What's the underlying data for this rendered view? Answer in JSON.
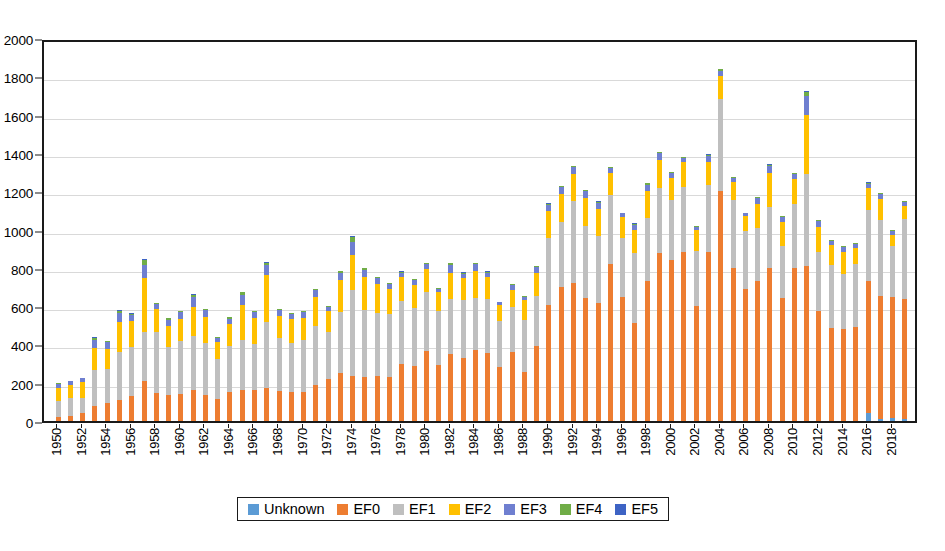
{
  "chart_data": {
    "type": "bar",
    "stacked": true,
    "title": "",
    "xlabel": "",
    "ylabel": "",
    "ylim": [
      0,
      2000
    ],
    "ytick_step": 200,
    "yticks": [
      0,
      200,
      400,
      600,
      800,
      1000,
      1200,
      1400,
      1600,
      1800,
      2000
    ],
    "grid": true,
    "xtick_interval": 2,
    "legend_position": "bottom",
    "categories": [
      "1950",
      "1951",
      "1952",
      "1953",
      "1954",
      "1955",
      "1956",
      "1957",
      "1958",
      "1959",
      "1960",
      "1961",
      "1962",
      "1963",
      "1964",
      "1965",
      "1966",
      "1967",
      "1968",
      "1969",
      "1970",
      "1971",
      "1972",
      "1973",
      "1974",
      "1975",
      "1976",
      "1977",
      "1978",
      "1979",
      "1980",
      "1981",
      "1982",
      "1983",
      "1984",
      "1985",
      "1986",
      "1987",
      "1988",
      "1989",
      "1990",
      "1991",
      "1992",
      "1993",
      "1994",
      "1995",
      "1996",
      "1997",
      "1998",
      "1999",
      "2000",
      "2001",
      "2002",
      "2003",
      "2004",
      "2005",
      "2006",
      "2007",
      "2008",
      "2009",
      "2010",
      "2011",
      "2012",
      "2013",
      "2014",
      "2015",
      "2016",
      "2017",
      "2018",
      "2019"
    ],
    "xtick_labels": [
      "1950",
      "1952",
      "1954",
      "1956",
      "1958",
      "1960",
      "1962",
      "1964",
      "1966",
      "1968",
      "1970",
      "1972",
      "1974",
      "1976",
      "1978",
      "1980",
      "1982",
      "1984",
      "1986",
      "1988",
      "1990",
      "1992",
      "1994",
      "1996",
      "1998",
      "2000",
      "2002",
      "2004",
      "2006",
      "2008",
      "2010",
      "2012",
      "2014",
      "2016",
      "2018"
    ],
    "series": [
      {
        "name": "Unknown",
        "color": "#5b9bd5",
        "values": [
          0,
          0,
          0,
          0,
          0,
          0,
          0,
          0,
          0,
          0,
          0,
          0,
          0,
          0,
          0,
          0,
          0,
          0,
          0,
          0,
          0,
          0,
          0,
          0,
          0,
          0,
          0,
          0,
          0,
          0,
          0,
          0,
          0,
          0,
          0,
          0,
          0,
          0,
          0,
          0,
          0,
          0,
          0,
          0,
          0,
          0,
          0,
          0,
          0,
          0,
          0,
          0,
          0,
          0,
          0,
          0,
          0,
          0,
          0,
          0,
          0,
          0,
          0,
          0,
          0,
          0,
          40,
          12,
          18,
          10
        ]
      },
      {
        "name": "EF0",
        "color": "#ed7d31",
        "values": [
          20,
          24,
          40,
          80,
          96,
          110,
          130,
          210,
          145,
          135,
          140,
          160,
          135,
          115,
          150,
          160,
          160,
          175,
          155,
          150,
          150,
          190,
          220,
          250,
          235,
          230,
          235,
          230,
          300,
          285,
          365,
          290,
          350,
          330,
          370,
          355,
          280,
          360,
          255,
          390,
          605,
          700,
          720,
          640,
          615,
          820,
          645,
          510,
          730,
          875,
          840,
          880,
          600,
          880,
          1200,
          800,
          690,
          730,
          800,
          640,
          800,
          810,
          575,
          485,
          480,
          490,
          690,
          640,
          630,
          625
        ]
      },
      {
        "name": "EF1",
        "color": "#bfbfbf",
        "values": [
          85,
          95,
          80,
          185,
          175,
          250,
          255,
          255,
          320,
          250,
          280,
          285,
          270,
          210,
          240,
          265,
          240,
          340,
          280,
          260,
          275,
          305,
          245,
          320,
          450,
          350,
          330,
          330,
          325,
          305,
          310,
          285,
          285,
          300,
          275,
          280,
          240,
          235,
          270,
          265,
          350,
          340,
          430,
          380,
          350,
          360,
          310,
          370,
          330,
          340,
          315,
          340,
          290,
          355,
          480,
          355,
          300,
          280,
          320,
          275,
          335,
          480,
          310,
          330,
          290,
          330,
          370,
          400,
          265,
          420
        ]
      },
      {
        "name": "EF2",
        "color": "#ffc000",
        "values": [
          70,
          70,
          85,
          115,
          105,
          155,
          135,
          280,
          120,
          110,
          115,
          150,
          140,
          90,
          115,
          180,
          140,
          245,
          115,
          125,
          115,
          155,
          110,
          165,
          180,
          170,
          150,
          130,
          125,
          120,
          120,
          100,
          140,
          115,
          140,
          115,
          85,
          90,
          105,
          120,
          140,
          145,
          140,
          145,
          140,
          115,
          110,
          115,
          140,
          150,
          115,
          130,
          105,
          120,
          120,
          95,
          80,
          125,
          175,
          125,
          130,
          310,
          130,
          105,
          115,
          85,
          115,
          110,
          60,
          70
        ]
      },
      {
        "name": "EF3",
        "color": "#6f7fd0",
        "values": [
          20,
          18,
          18,
          45,
          35,
          50,
          35,
          70,
          25,
          35,
          35,
          55,
          35,
          20,
          30,
          55,
          30,
          55,
          30,
          25,
          30,
          35,
          22,
          40,
          70,
          40,
          30,
          25,
          25,
          25,
          25,
          15,
          40,
          25,
          35,
          25,
          15,
          25,
          20,
          30,
          35,
          35,
          35,
          35,
          35,
          25,
          20,
          30,
          35,
          35,
          25,
          25,
          20,
          30,
          30,
          20,
          15,
          30,
          35,
          25,
          25,
          95,
          30,
          20,
          25,
          20,
          25,
          25,
          20,
          20
        ]
      },
      {
        "name": "EF4",
        "color": "#70ad47",
        "values": [
          3,
          3,
          3,
          10,
          6,
          12,
          6,
          25,
          5,
          6,
          6,
          10,
          6,
          3,
          6,
          12,
          6,
          12,
          5,
          5,
          5,
          6,
          4,
          9,
          25,
          8,
          6,
          5,
          5,
          5,
          5,
          3,
          8,
          5,
          6,
          5,
          3,
          5,
          4,
          6,
          6,
          6,
          6,
          6,
          6,
          4,
          3,
          6,
          8,
          6,
          4,
          4,
          3,
          6,
          6,
          3,
          3,
          6,
          8,
          5,
          5,
          22,
          6,
          4,
          5,
          4,
          5,
          5,
          4,
          4
        ]
      },
      {
        "name": "EF5",
        "color": "#3d63c4",
        "values": [
          1,
          1,
          0,
          5,
          2,
          4,
          1,
          6,
          1,
          1,
          1,
          2,
          1,
          0,
          1,
          3,
          1,
          3,
          1,
          1,
          1,
          1,
          0,
          2,
          7,
          2,
          1,
          1,
          1,
          1,
          1,
          0,
          2,
          1,
          1,
          1,
          0,
          1,
          0,
          1,
          1,
          1,
          1,
          1,
          1,
          0,
          0,
          1,
          2,
          1,
          0,
          0,
          0,
          1,
          1,
          0,
          0,
          1,
          2,
          1,
          1,
          6,
          1,
          1,
          1,
          0,
          1,
          1,
          1,
          1
        ]
      }
    ]
  }
}
